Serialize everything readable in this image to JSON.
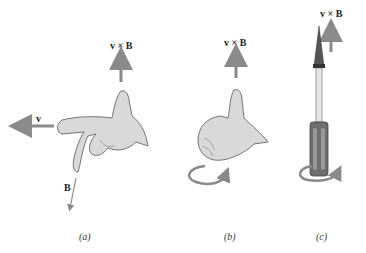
{
  "figure": {
    "panels": [
      {
        "id": "a",
        "caption": "(a)",
        "labels": {
          "top": "v × B",
          "velocity": "v",
          "field": "B"
        }
      },
      {
        "id": "b",
        "caption": "(b)",
        "labels": {
          "top": "v × B"
        }
      },
      {
        "id": "c",
        "caption": "(c)",
        "labels": {
          "top": "v × B"
        }
      }
    ]
  },
  "colors": {
    "arrow": "#8a8a8a",
    "skin": "#d9d9d9",
    "outline": "#555555",
    "handle": "#6e6e6e"
  }
}
